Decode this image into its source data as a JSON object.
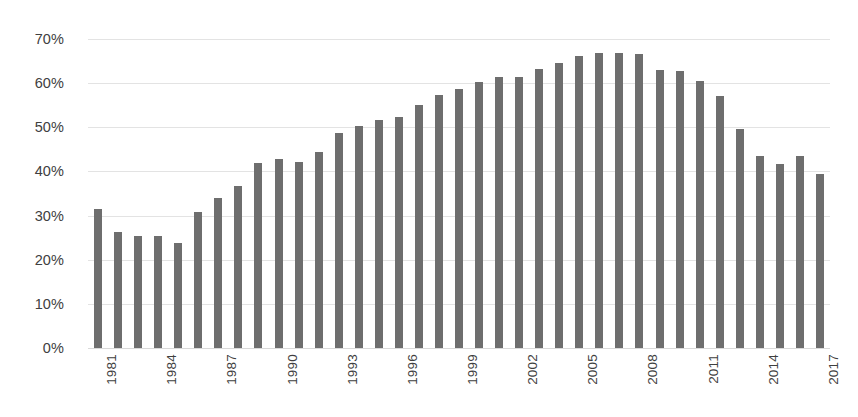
{
  "chart_data": {
    "type": "bar",
    "title": "",
    "xlabel": "",
    "ylabel": "",
    "ylim": [
      0,
      70
    ],
    "grid": true,
    "legend": null,
    "bar_color": "#6e6e6e",
    "gridline_color": "#e3e3e3",
    "y_ticks": [
      0,
      10,
      20,
      30,
      40,
      50,
      60,
      70
    ],
    "y_tick_labels": [
      "0%",
      "10%",
      "20%",
      "30%",
      "40%",
      "50%",
      "60%",
      "70%"
    ],
    "x_tick_labels": [
      "1981",
      "1984",
      "1987",
      "1990",
      "1993",
      "1996",
      "1999",
      "2002",
      "2005",
      "2008",
      "2011",
      "2014",
      "2017"
    ],
    "x_tick_every": 3,
    "categories": [
      "1981",
      "1982",
      "1983",
      "1984",
      "1985",
      "1986",
      "1987",
      "1988",
      "1989",
      "1990",
      "1991",
      "1992",
      "1993",
      "1994",
      "1995",
      "1996",
      "1997",
      "1998",
      "1999",
      "2000",
      "2001",
      "2002",
      "2003",
      "2004",
      "2005",
      "2006",
      "2007",
      "2008",
      "2009",
      "2010",
      "2011",
      "2012",
      "2013",
      "2014",
      "2015",
      "2016",
      "2017"
    ],
    "values": [
      31.6,
      26.2,
      25.3,
      25.4,
      23.9,
      30.8,
      33.9,
      36.6,
      41.8,
      42.8,
      42.2,
      44.5,
      48.7,
      50.2,
      51.6,
      52.3,
      55.1,
      57.3,
      58.6,
      60.2,
      61.5,
      61.3,
      63.3,
      64.5,
      66.1,
      66.8,
      66.8,
      66.5,
      62.9,
      62.8,
      60.4,
      57.1,
      49.6,
      43.6,
      41.6,
      43.6,
      39.4
    ]
  }
}
